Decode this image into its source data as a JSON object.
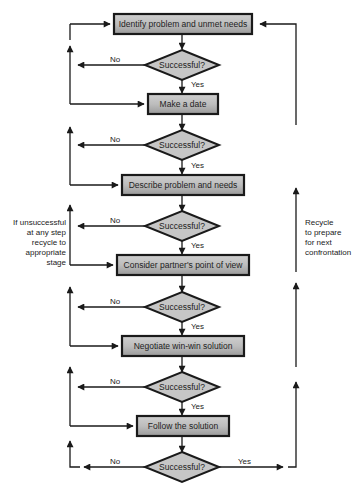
{
  "diagram": {
    "type": "flowchart",
    "steps": [
      {
        "label": "Identify problem and unmet needs"
      },
      {
        "label": "Make a date"
      },
      {
        "label": "Describe problem and needs"
      },
      {
        "label": "Consider partner's point of view"
      },
      {
        "label": "Negotiate win-win solution"
      },
      {
        "label": "Follow the solution"
      }
    ],
    "decisions": [
      {
        "label": "Successful?",
        "no": "No",
        "yes": "Yes"
      },
      {
        "label": "Successful?",
        "no": "No",
        "yes": "Yes"
      },
      {
        "label": "Successful?",
        "no": "No",
        "yes": "Yes"
      },
      {
        "label": "Successful?",
        "no": "No",
        "yes": "Yes"
      },
      {
        "label": "Successful?",
        "no": "No",
        "yes": "Yes"
      },
      {
        "label": "Successful?",
        "no": "No",
        "yes": "Yes"
      }
    ],
    "left_note": "If unsuccessful at any step recycle to appropriate stage",
    "left_note_lines": [
      "If unsuccessful",
      "at any step",
      "recycle to",
      "appropriate",
      "stage"
    ],
    "right_note": "Recycle to prepare for next confrontation",
    "right_note_lines": [
      "Recycle",
      "to prepare",
      "for next",
      "confrontation"
    ],
    "colors": {
      "box_fill_light": "#d8d8d8",
      "box_fill_dark": "#a8a8a8",
      "diamond_fill": "#c8c8c8",
      "stroke": "#1a1a1a"
    }
  }
}
